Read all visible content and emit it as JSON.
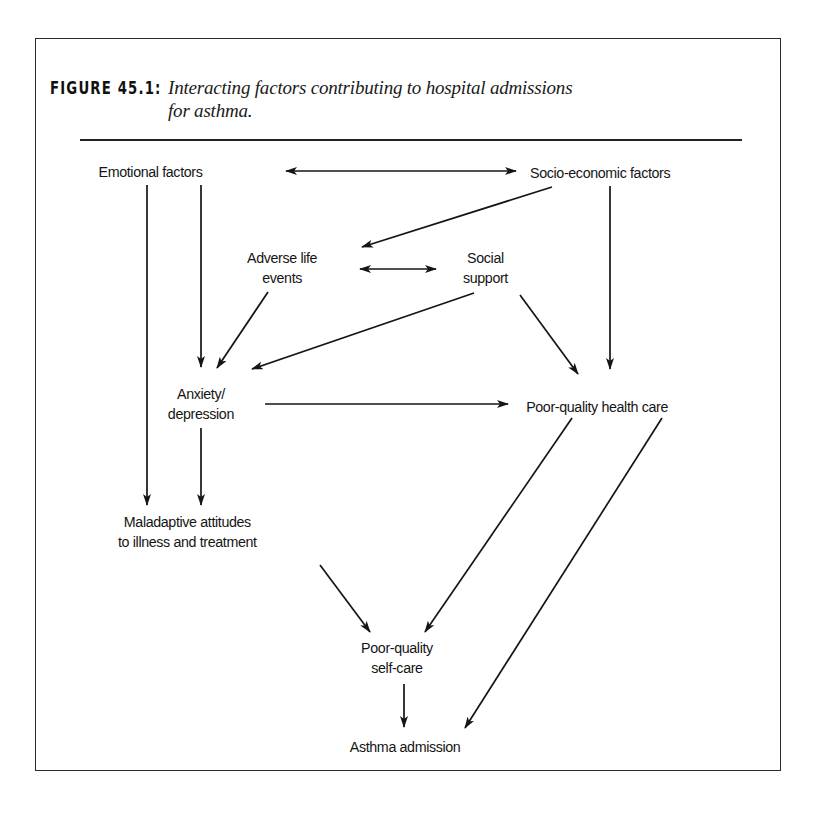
{
  "figure": {
    "label": "FIGURE 45.1:",
    "caption_line1": "Interacting factors contributing to hospital admissions",
    "caption_line2": "for asthma."
  },
  "nodes": {
    "emotional": {
      "label": "Emotional factors"
    },
    "socioeconomic": {
      "label": "Socio-economic factors"
    },
    "adverse_life_events": {
      "line1": "Adverse life",
      "line2": "events"
    },
    "social_support": {
      "line1": "Social",
      "line2": "support"
    },
    "anxiety_depression": {
      "line1": "Anxiety/",
      "line2": "depression"
    },
    "poor_health_care": {
      "label": "Poor-quality health care"
    },
    "maladaptive": {
      "line1": "Maladaptive attitudes",
      "line2": "to illness and treatment"
    },
    "poor_self_care": {
      "line1": "Poor-quality",
      "line2": "self-care"
    },
    "asthma_admission": {
      "label": "Asthma admission"
    }
  },
  "edges": [
    {
      "from": "Emotional factors",
      "to": "Socio-economic factors",
      "type": "bidirectional"
    },
    {
      "from": "Socio-economic factors",
      "to": "Adverse life events",
      "type": "directed"
    },
    {
      "from": "Socio-economic factors",
      "to": "Poor-quality health care",
      "type": "directed"
    },
    {
      "from": "Adverse life events",
      "to": "Social support",
      "type": "bidirectional"
    },
    {
      "from": "Adverse life events",
      "to": "Anxiety/depression",
      "type": "directed"
    },
    {
      "from": "Social support",
      "to": "Anxiety/depression",
      "type": "directed"
    },
    {
      "from": "Social support",
      "to": "Poor-quality health care",
      "type": "directed"
    },
    {
      "from": "Emotional factors",
      "to": "Anxiety/depression",
      "type": "directed"
    },
    {
      "from": "Emotional factors",
      "to": "Maladaptive attitudes to illness and treatment",
      "type": "directed"
    },
    {
      "from": "Anxiety/depression",
      "to": "Poor-quality health care",
      "type": "directed"
    },
    {
      "from": "Anxiety/depression",
      "to": "Maladaptive attitudes to illness and treatment",
      "type": "directed"
    },
    {
      "from": "Maladaptive attitudes to illness and treatment",
      "to": "Poor-quality self-care",
      "type": "directed"
    },
    {
      "from": "Poor-quality health care",
      "to": "Poor-quality self-care",
      "type": "directed"
    },
    {
      "from": "Poor-quality health care",
      "to": "Asthma admission",
      "type": "directed"
    },
    {
      "from": "Poor-quality self-care",
      "to": "Asthma admission",
      "type": "directed"
    }
  ],
  "colors": {
    "ink": "#151515",
    "paper": "#ffffff"
  }
}
